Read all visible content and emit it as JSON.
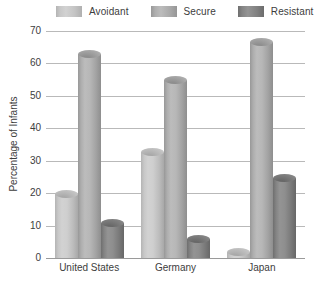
{
  "chart_data": {
    "type": "bar",
    "title": "",
    "xlabel": "",
    "ylabel": "Percentage of Infants",
    "ylim": [
      0,
      70
    ],
    "yticks": [
      0,
      10,
      20,
      30,
      40,
      50,
      60,
      70
    ],
    "grid": true,
    "legend_position": "top",
    "categories": [
      "United States",
      "Germany",
      "Japan"
    ],
    "series": [
      {
        "name": "Avoidant",
        "color": "#cccccc",
        "values": [
          21,
          34,
          3
        ]
      },
      {
        "name": "Secure",
        "color": "#b0b0b0",
        "values": [
          64,
          56,
          68
        ]
      },
      {
        "name": "Resistant",
        "color": "#888888",
        "values": [
          12,
          7,
          26
        ]
      }
    ]
  },
  "legend": {
    "items": [
      {
        "label": "Avoidant"
      },
      {
        "label": "Secure"
      },
      {
        "label": "Resistant"
      }
    ]
  },
  "axes": {
    "y_title": "Percentage of Infants",
    "y_tick_labels": [
      "70",
      "60",
      "50",
      "40",
      "30",
      "20",
      "10",
      "0"
    ],
    "x_tick_labels": [
      "United States",
      "Germany",
      "Japan"
    ]
  }
}
